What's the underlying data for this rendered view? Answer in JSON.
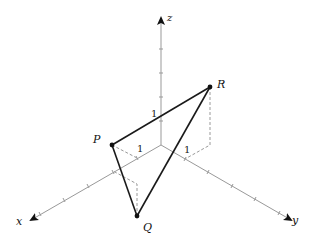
{
  "diagram": {
    "type": "3d-coordinate-axes",
    "axes": {
      "x": {
        "label": "x"
      },
      "y": {
        "label": "y"
      },
      "z": {
        "label": "z"
      }
    },
    "unit_labels": {
      "x": "1",
      "y": "1",
      "z": "1"
    },
    "points": [
      {
        "name": "P",
        "label": "P"
      },
      {
        "name": "Q",
        "label": "Q"
      },
      {
        "name": "R",
        "label": "R"
      }
    ],
    "triangle": [
      "P",
      "Q",
      "R"
    ],
    "colors": {
      "axis": "#888888",
      "triangle": "#1a1a1a",
      "dashed": "#999999"
    }
  }
}
